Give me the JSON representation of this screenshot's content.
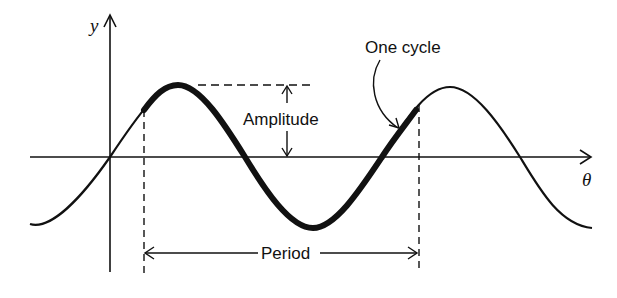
{
  "diagram": {
    "axes": {
      "y_label": "y",
      "x_label": "θ"
    },
    "annotations": {
      "amplitude": "Amplitude",
      "period": "Period",
      "cycle": "One cycle"
    },
    "colors": {
      "stroke": "#111111",
      "background": "#ffffff"
    }
  }
}
